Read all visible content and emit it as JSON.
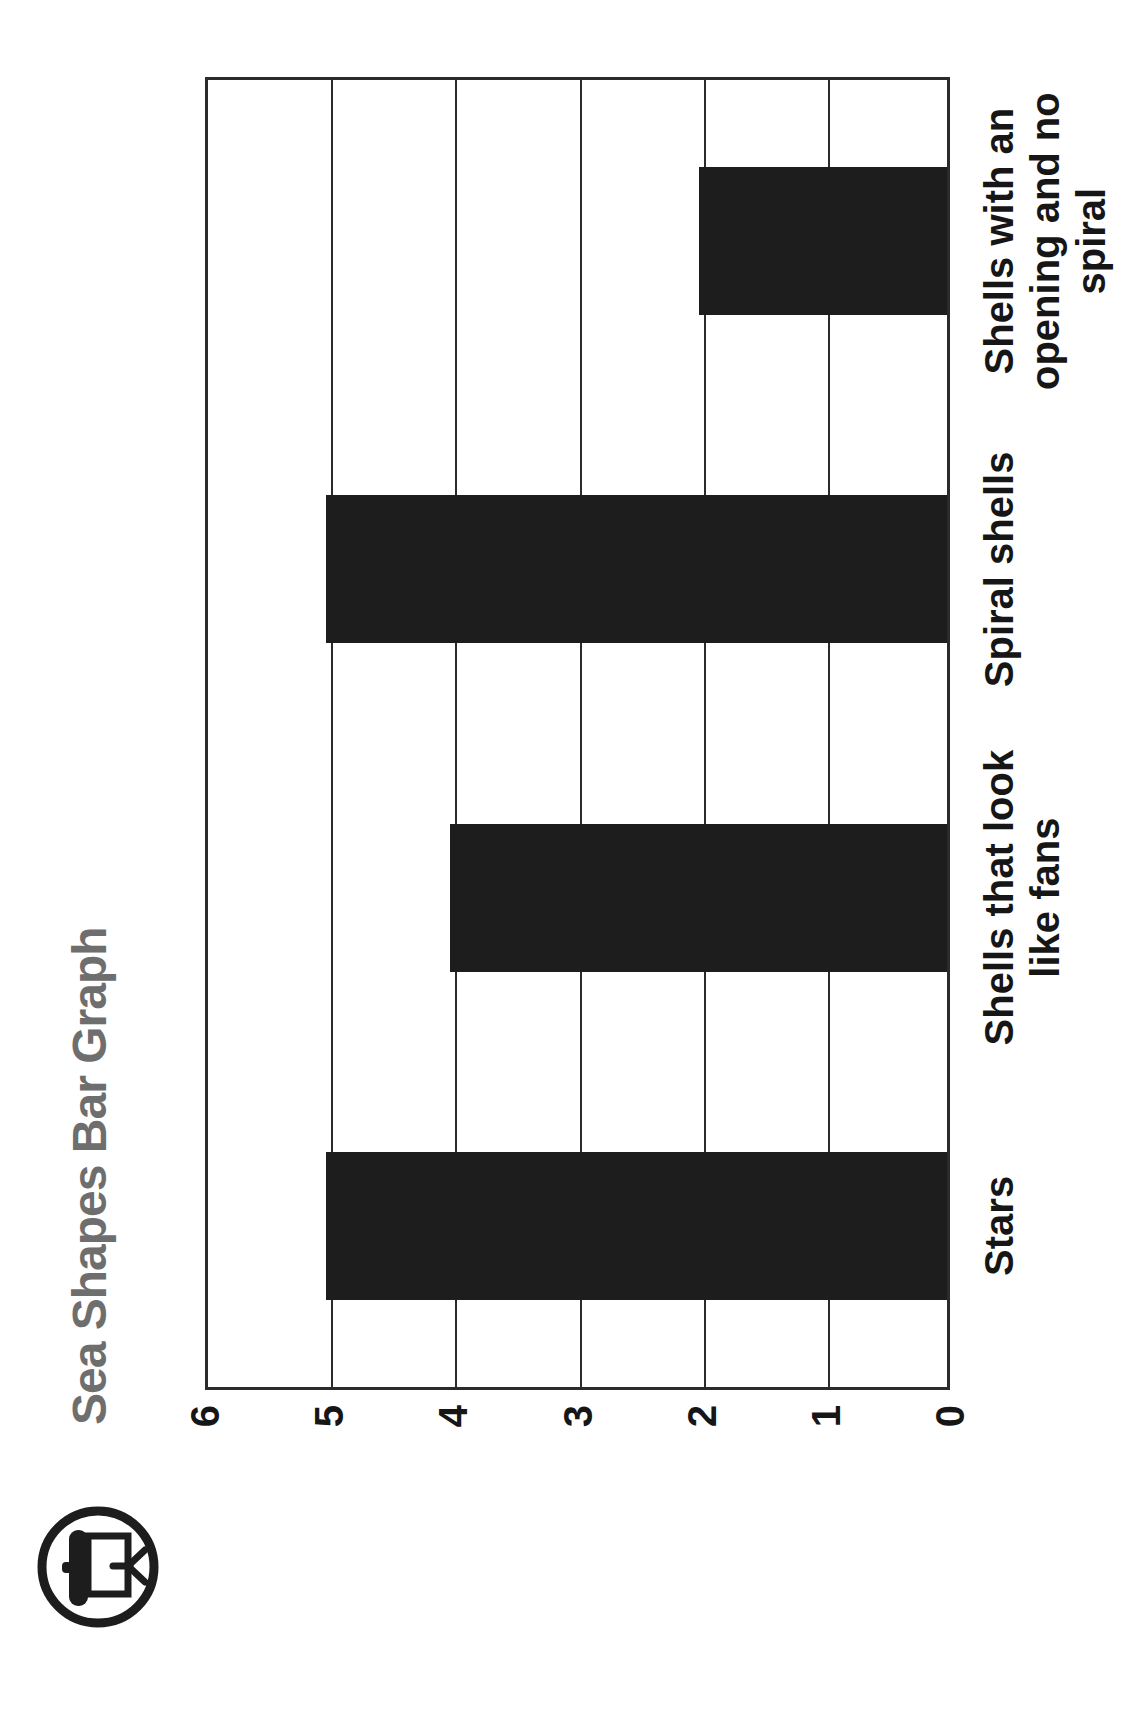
{
  "header": {
    "title": "Sea Shapes Bar Graph",
    "title_color": "#6e6e6e",
    "icon": "projector-screen-icon"
  },
  "chart_data": {
    "type": "bar",
    "orientation": "vertical-bars-on-page-rotated-90ccw",
    "title": "Sea Shapes Bar Graph",
    "categories": [
      "Stars",
      "Shells that look like fans",
      "Spiral shells",
      "Shells with an opening and no spiral"
    ],
    "category_lines": [
      [
        "Stars"
      ],
      [
        "Shells that look",
        "like fans"
      ],
      [
        "Spiral shells"
      ],
      [
        "Shells with an",
        "opening and no",
        "spiral"
      ]
    ],
    "values": [
      5,
      4,
      5,
      2
    ],
    "ylim": [
      0,
      6
    ],
    "ytick_labels": [
      "6",
      "5",
      "4",
      "3",
      "2",
      "1",
      "0"
    ],
    "xlabel": "",
    "ylabel": "",
    "grid": "value-lines-only",
    "legend": "none",
    "bar_color": "#1d1d1d",
    "line_color": "#2b2b2b",
    "text_color": "#161616"
  }
}
